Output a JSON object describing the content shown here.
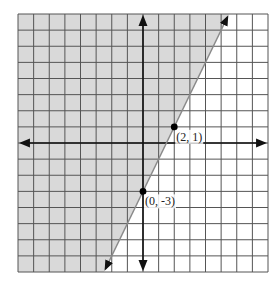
{
  "chart_data": {
    "type": "line",
    "title": "",
    "xlabel": "",
    "ylabel": "",
    "xlim": [
      -8,
      8
    ],
    "ylim": [
      -8,
      8
    ],
    "grid": true,
    "grid_step": 1,
    "boundary_line": {
      "equation": "y = 2x - 3",
      "slope": 2,
      "intercept": -3,
      "style": "solid",
      "color": "#888888"
    },
    "shaded_region": {
      "description": "Region to the left/above the line (y >= 2x - 3)",
      "inequality": "y ≥ 2x - 3",
      "fill_color": "#d9d9d9"
    },
    "points": [
      {
        "x": 0,
        "y": -3,
        "label": "(0, -3)"
      },
      {
        "x": 2,
        "y": 1,
        "label": "(2, 1)"
      }
    ]
  },
  "colors": {
    "grid": "#555555",
    "axis": "#111111",
    "shade": "#d9d9d9",
    "line": "#8a8a8a",
    "point": "#000000"
  }
}
